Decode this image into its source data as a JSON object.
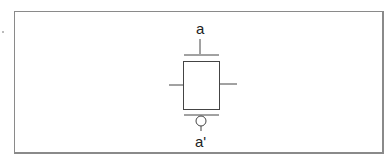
{
  "diagram": {
    "type": "transistor-symbol",
    "top_label": "a",
    "bottom_label": "a'",
    "stroke_color": "#333333",
    "frame_color": "#8a8a8a"
  }
}
